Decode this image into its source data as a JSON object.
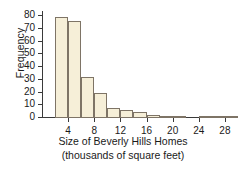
{
  "chart_data": {
    "type": "bar",
    "title": "",
    "subtitle": "",
    "xlabel_line1": "Size of Beverly Hills Homes",
    "xlabel_line2": "(thousands of square feet)",
    "ylabel": "Frequency",
    "grid": false,
    "legend": "none",
    "xlim": [
      0,
      30
    ],
    "ylim": [
      0,
      84
    ],
    "bin_width": 2,
    "x_tick_labels": [
      "4",
      "8",
      "12",
      "16",
      "20",
      "24",
      "28"
    ],
    "x_tick_values": [
      4,
      8,
      12,
      16,
      20,
      24,
      28
    ],
    "y_tick_labels": [
      "0",
      "10",
      "20",
      "30",
      "40",
      "50",
      "60",
      "70",
      "80"
    ],
    "y_tick_values": [
      0,
      10,
      20,
      30,
      40,
      50,
      60,
      70,
      80
    ],
    "bin_starts": [
      2,
      4,
      6,
      8,
      10,
      12,
      14,
      16,
      18,
      20,
      22,
      24,
      26,
      28
    ],
    "categories": [
      "2-4",
      "4-6",
      "6-8",
      "8-10",
      "10-12",
      "12-14",
      "14-16",
      "16-18",
      "18-20",
      "20-22",
      "22-24",
      "24-26",
      "26-28",
      "28-30"
    ],
    "values": [
      79,
      76,
      32,
      20,
      8,
      6,
      5,
      2,
      1,
      1,
      0,
      1,
      1,
      1
    ],
    "colors": {
      "bar_fill": "#f6efd8",
      "bar_edge": "#7e7466",
      "axis": "#3a3a3a",
      "text": "#1a1a1a",
      "background": "#ffffff"
    }
  }
}
